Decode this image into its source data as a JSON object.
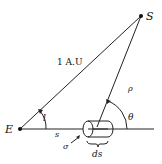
{
  "diagram": {
    "points": {
      "earth": {
        "label": "E"
      },
      "sun": {
        "label": "S"
      }
    },
    "labels": {
      "distance": "1 A.U",
      "rho": "ρ",
      "theta": "θ",
      "l": "l",
      "s": "s",
      "sigma": "σ",
      "ds": "ds"
    }
  }
}
